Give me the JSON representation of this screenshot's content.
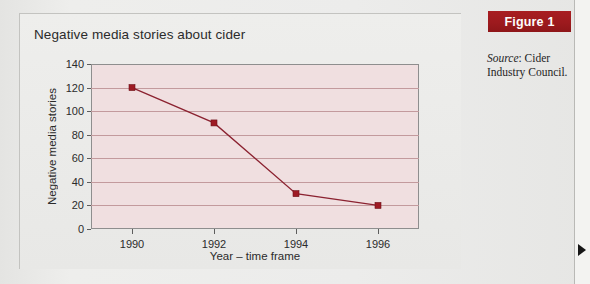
{
  "figure": {
    "banner_label": "Figure 1",
    "source_prefix": "Source",
    "source_separator": ": ",
    "source_text": "Cider Industry Council.",
    "banner_color": "#9d1a1e"
  },
  "chart_panel": {
    "title": "Negative media stories about cider"
  },
  "margin_marker": {
    "name": "right-margin-arrow"
  },
  "chart_data": {
    "type": "line",
    "title": "Negative media stories about cider",
    "xlabel": "Year – time frame",
    "ylabel": "Negative media stories",
    "x": [
      1990,
      1992,
      1994,
      1996
    ],
    "categories": [
      "1990",
      "1992",
      "1994",
      "1996"
    ],
    "values": [
      120,
      90,
      30,
      20
    ],
    "series": [
      {
        "name": "Negative media stories",
        "values": [
          120,
          90,
          30,
          20
        ],
        "line_color": "#8b2230",
        "marker_color": "#9e1b24",
        "marker": "square"
      }
    ],
    "ylim": [
      0,
      140
    ],
    "yticks": [
      0,
      20,
      40,
      60,
      80,
      100,
      120,
      140
    ],
    "ytick_labels": [
      "0",
      "20",
      "40",
      "60",
      "80",
      "100",
      "120",
      "140"
    ],
    "xlim": [
      1989,
      1997
    ],
    "xticks": [
      1990,
      1992,
      1994,
      1996
    ],
    "xtick_labels": [
      "1990",
      "1992",
      "1994",
      "1996"
    ],
    "grid": "horizontal",
    "gridline_color": "#c39a9d",
    "plot_background": "#f0dfe0",
    "legend": "none"
  }
}
